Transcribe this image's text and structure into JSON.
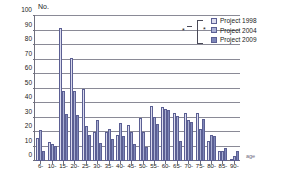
{
  "chart_data": {
    "type": "bar",
    "title": "",
    "ylabel": "No.",
    "xlabel": "age",
    "ylim": [
      0,
      100
    ],
    "yticks": [
      0,
      10,
      20,
      30,
      40,
      50,
      60,
      70,
      80,
      90,
      100
    ],
    "grid": true,
    "legend_position": "top-right",
    "categories": [
      "6-",
      "10-",
      "15-",
      "20-",
      "25-",
      "30-",
      "35-",
      "40-",
      "45-",
      "50-",
      "55-",
      "60-",
      "65-",
      "70-",
      "75-",
      "80-",
      "85-",
      "90-"
    ],
    "series": [
      {
        "name": "Project 1998",
        "color": "#dcdcee",
        "values": [
          16,
          13,
          92,
          71,
          50,
          20,
          20,
          18,
          25,
          30,
          38,
          37,
          33,
          33,
          33,
          14,
          7,
          1
        ]
      },
      {
        "name": "Project 2004",
        "color": "#a8aed2",
        "values": [
          21.5,
          12,
          48.5,
          48,
          24,
          28,
          22,
          26,
          20,
          20,
          30.5,
          36,
          31,
          28,
          22,
          18,
          7,
          3.5
        ]
      },
      {
        "name": "Project 2009",
        "color": "#7d86b8",
        "values": [
          7,
          10.5,
          32.5,
          31.5,
          18,
          12.5,
          15,
          17,
          11.5,
          10,
          25.5,
          35,
          13.5,
          27,
          29,
          17.5,
          9,
          7
        ]
      }
    ],
    "annotations": [
      {
        "name": "significance-star-inner",
        "symbol": "*"
      },
      {
        "name": "significance-star-outer",
        "symbol": "*"
      }
    ]
  },
  "legend": {
    "items": [
      {
        "label": "Project 1998"
      },
      {
        "label": "Project 2004"
      },
      {
        "label": "Project 2009"
      }
    ]
  }
}
